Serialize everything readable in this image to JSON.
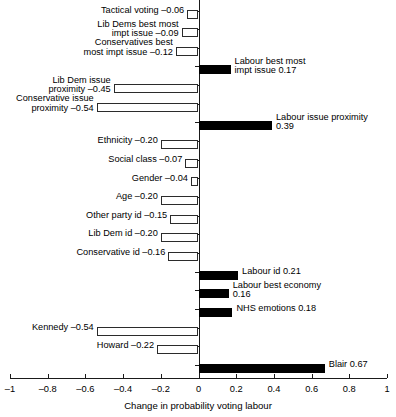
{
  "chart_data": {
    "type": "bar",
    "orientation": "horizontal",
    "title": "",
    "xlabel": "Change in probability voting labour",
    "ylabel": "",
    "xlim": [
      -1,
      1
    ],
    "xticks": [
      -1,
      -0.8,
      -0.6,
      -0.4,
      -0.2,
      0,
      0.2,
      0.4,
      0.6,
      0.8,
      1
    ],
    "xticklabels": [
      "–1",
      "–0.8",
      "–0.6",
      "–0.4",
      "–0.2",
      "0",
      "0.2",
      "0.4",
      "0.6",
      "0.8",
      "1"
    ],
    "grid": false,
    "legend": null,
    "bar_style": {
      "negative_fill": "#ffffff",
      "negative_edge": "#2b2b2b",
      "positive_fill": "#000000",
      "positive_edge": "#000000"
    },
    "categories": [
      "Tactical voting",
      "Lib Dems best most impt issue",
      "Conservatives best most impt issue",
      "Labour best most impt issue",
      "Lib Dem issue proximity",
      "Conservative issue proximity",
      "Labour issue proximity",
      "Ethnicity",
      "Social class",
      "Gender",
      "Age",
      "Other party id",
      "Lib Dem id",
      "Conservative id",
      "Labour id",
      "Labour best economy",
      "NHS emotions",
      "Kennedy",
      "Howard",
      "Blair"
    ],
    "values": [
      -0.06,
      -0.09,
      -0.12,
      0.17,
      -0.45,
      -0.54,
      0.39,
      -0.2,
      -0.07,
      -0.04,
      -0.2,
      -0.15,
      -0.2,
      -0.16,
      0.21,
      0.16,
      0.18,
      -0.54,
      -0.22,
      0.67
    ],
    "bars": [
      {
        "name": "tactical-voting",
        "value": -0.06,
        "label": "Tactical voting –0.06",
        "label_lines": [
          "Tactical voting –0.06"
        ],
        "side": "left"
      },
      {
        "name": "lib-dems-best-most-impt-issue",
        "value": -0.09,
        "label": "Lib Dems best most impt issue –0.09",
        "label_lines": [
          "Lib Dems best most",
          "impt issue –0.09"
        ],
        "side": "left"
      },
      {
        "name": "conservatives-best-most-impt-issue",
        "value": -0.12,
        "label": "Conservatives best most impt issue –0.12",
        "label_lines": [
          "Conservatives best",
          "most impt issue –0.12"
        ],
        "side": "left"
      },
      {
        "name": "labour-best-most-impt-issue",
        "value": 0.17,
        "label": "Labour best most impt issue 0.17",
        "label_lines": [
          "Labour best most",
          "impt issue 0.17"
        ],
        "side": "right"
      },
      {
        "name": "lib-dem-issue-proximity",
        "value": -0.45,
        "label": "Lib Dem issue proximity –0.45",
        "label_lines": [
          "Lib Dem issue",
          "proximity –0.45"
        ],
        "side": "left"
      },
      {
        "name": "conservative-issue-proximity",
        "value": -0.54,
        "label": "Conservative issue proximity –0.54",
        "label_lines": [
          "Conservative issue",
          "proximity –0.54"
        ],
        "side": "left"
      },
      {
        "name": "labour-issue-proximity",
        "value": 0.39,
        "label": "Labour issue proximity 0.39",
        "label_lines": [
          "Labour issue proximity",
          "0.39"
        ],
        "side": "right"
      },
      {
        "name": "ethnicity",
        "value": -0.2,
        "label": "Ethnicity –0.20",
        "label_lines": [
          "Ethnicity –0.20"
        ],
        "side": "left"
      },
      {
        "name": "social-class",
        "value": -0.07,
        "label": "Social class –0.07",
        "label_lines": [
          "Social class –0.07"
        ],
        "side": "left"
      },
      {
        "name": "gender",
        "value": -0.04,
        "label": "Gender –0.04",
        "label_lines": [
          "Gender –0.04"
        ],
        "side": "left"
      },
      {
        "name": "age",
        "value": -0.2,
        "label": "Age –0.20",
        "label_lines": [
          "Age –0.20"
        ],
        "side": "left"
      },
      {
        "name": "other-party-id",
        "value": -0.15,
        "label": "Other party id –0.15",
        "label_lines": [
          "Other party id –0.15"
        ],
        "side": "left"
      },
      {
        "name": "lib-dem-id",
        "value": -0.2,
        "label": "Lib Dem id –0.20",
        "label_lines": [
          "Lib Dem id –0.20"
        ],
        "side": "left"
      },
      {
        "name": "conservative-id",
        "value": -0.16,
        "label": "Conservative id –0.16",
        "label_lines": [
          "Conservative id –0.16"
        ],
        "side": "left"
      },
      {
        "name": "labour-id",
        "value": 0.21,
        "label": "Labour id 0.21",
        "label_lines": [
          "Labour id 0.21"
        ],
        "side": "right"
      },
      {
        "name": "labour-best-economy",
        "value": 0.16,
        "label": "Labour best economy 0.16",
        "label_lines": [
          "Labour best economy",
          "0.16"
        ],
        "side": "right"
      },
      {
        "name": "nhs-emotions",
        "value": 0.18,
        "label": "NHS emotions 0.18",
        "label_lines": [
          "NHS emotions 0.18"
        ],
        "side": "right"
      },
      {
        "name": "kennedy",
        "value": -0.54,
        "label": "Kennedy –0.54",
        "label_lines": [
          "Kennedy –0.54"
        ],
        "side": "left"
      },
      {
        "name": "howard",
        "value": -0.22,
        "label": "Howard –0.22",
        "label_lines": [
          "Howard –0.22"
        ],
        "side": "left"
      },
      {
        "name": "blair",
        "value": 0.67,
        "label": "Blair 0.67",
        "label_lines": [
          "Blair 0.67"
        ],
        "side": "right"
      }
    ]
  }
}
